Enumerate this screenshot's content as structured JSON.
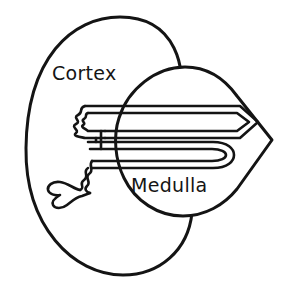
{
  "diagram": {
    "background_color": "#ffffff",
    "stroke_color": "#141414",
    "fill_color": "#ffffff",
    "labels": {
      "cortex": "Cortex",
      "medulla": "Medulla"
    },
    "structures": [
      {
        "name": "cortex-outline",
        "shape": "oval",
        "label": "Cortex"
      },
      {
        "name": "medulla-outline",
        "shape": "circle-with-right-apex",
        "label": "Medulla"
      },
      {
        "name": "nephron-tubule",
        "shape": "loop-of-henle",
        "label": ""
      },
      {
        "name": "glomerulus-capsule",
        "shape": "forked-cup",
        "label": ""
      }
    ]
  }
}
